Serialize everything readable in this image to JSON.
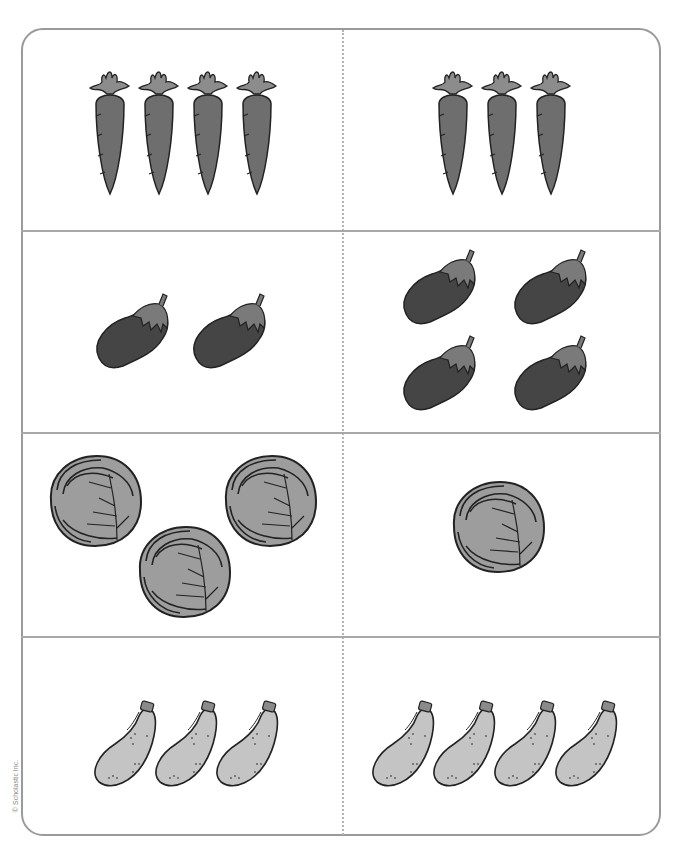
{
  "page": {
    "copyright": "© Scholastic Inc."
  },
  "colors": {
    "frame_border": "#9a9a9a",
    "carrot_body": "#6e6e6e",
    "carrot_leaf": "#8c8c8c",
    "eggplant_body": "#454545",
    "eggplant_cap": "#7a7a7a",
    "cabbage": "#9d9d9d",
    "zucchini": "#c4c4c4",
    "outline": "#222222"
  },
  "cards": [
    {
      "row": 1,
      "col": "left",
      "item": "carrot",
      "count": 4
    },
    {
      "row": 1,
      "col": "right",
      "item": "carrot",
      "count": 3
    },
    {
      "row": 2,
      "col": "left",
      "item": "eggplant",
      "count": 2
    },
    {
      "row": 2,
      "col": "right",
      "item": "eggplant",
      "count": 4
    },
    {
      "row": 3,
      "col": "left",
      "item": "cabbage",
      "count": 3
    },
    {
      "row": 3,
      "col": "right",
      "item": "cabbage",
      "count": 1
    },
    {
      "row": 4,
      "col": "left",
      "item": "zucchini",
      "count": 3
    },
    {
      "row": 4,
      "col": "right",
      "item": "zucchini",
      "count": 4
    }
  ]
}
